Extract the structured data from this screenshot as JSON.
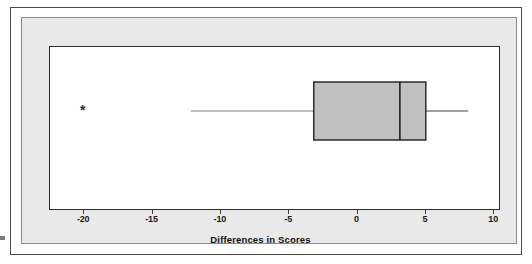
{
  "chart_data": {
    "type": "boxplot",
    "title": "",
    "xlabel": "Differences in Scores",
    "ylabel": "",
    "orientation": "horizontal",
    "xlim": [
      -22.5,
      10.5
    ],
    "grid": false,
    "legend": null,
    "xticks": [
      -20,
      -15,
      -10,
      -5,
      0,
      5,
      10
    ],
    "xtick_labels": [
      "-20",
      "-15",
      "-10",
      "-5",
      "0",
      "5",
      "10"
    ],
    "boxes": [
      {
        "name": "Differences in Scores",
        "whisker_low": -12.2,
        "q1": -3.2,
        "median": 3.1,
        "q3": 5.0,
        "whisker_high": 8.1,
        "outliers": [
          -20.1
        ],
        "box_fill": "#c0c0c0",
        "box_edge": "#202020",
        "whisker_color": "#808080",
        "median_color": "#202020",
        "outlier_marker": "*"
      }
    ]
  },
  "figure": {
    "panel_background": "#e9e9e9",
    "plot_background": "#ffffff",
    "frame_color": "#4a4a4a"
  }
}
